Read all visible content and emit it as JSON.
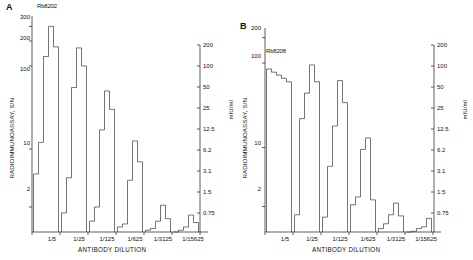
{
  "figure": {
    "panels": [
      {
        "letter": "A",
        "series_label": "Rb8202",
        "ylabel": "RADIOIMMUNOASSAY, S/N",
        "y2label": "mIU/ml",
        "xlabel": "ANTIBODY DILUTION",
        "yticks": [
          "300",
          "200",
          "100",
          "10",
          "2"
        ],
        "y2ticks": [
          "200",
          "100",
          "50",
          "25",
          "12.5",
          "6.2",
          "3.1",
          "1.5",
          "0.75"
        ],
        "xticks": [
          "1/5",
          "1/25",
          "1/125",
          "1/625",
          "1/3125",
          "1/15625"
        ]
      },
      {
        "letter": "B",
        "series_label": "Rb8208",
        "ylabel": "RADIOIMMUNOASSAY, S/N",
        "y2label": "mIU/ml",
        "xlabel": "ANTIBODY DILUTION",
        "yticks": [
          "200",
          "100",
          "10",
          "2"
        ],
        "y2ticks": [
          "200",
          "100",
          "50",
          "25",
          "12.5",
          "6.2",
          "3.1",
          "1.5",
          "0.75"
        ],
        "xticks": [
          "1/5",
          "1/25",
          "1/125",
          "1/625",
          "1/3125",
          "1/15625"
        ]
      }
    ]
  },
  "chart_data": [
    {
      "type": "bar",
      "title": "Rb8202",
      "panel": "A",
      "xlabel": "ANTIBODY DILUTION",
      "ylabel": "RADIOIMMUNOASSAY, S/N",
      "y2label": "mIU/ml",
      "yscale": "log",
      "ylim": [
        1,
        400
      ],
      "y_tick_values": [
        300,
        200,
        100,
        10,
        2
      ],
      "y2_tick_values": [
        200,
        100,
        50,
        25,
        12.5,
        6.2,
        3.1,
        1.5,
        0.75
      ],
      "categories": [
        "1/5",
        "1/25",
        "1/125",
        "1/625",
        "1/3125",
        "1/15625"
      ],
      "groups": [
        {
          "dilution": "1/5",
          "steps": [
            5.0,
            12.0,
            130.0,
            300.0,
            170.0
          ]
        },
        {
          "dilution": "1/25",
          "steps": [
            1.7,
            4.5,
            55.0,
            165.0,
            100.0
          ]
        },
        {
          "dilution": "1/125",
          "steps": [
            1.35,
            2.0,
            17.0,
            50.0,
            30.0
          ]
        },
        {
          "dilution": "1/625",
          "steps": [
            1.15,
            1.25,
            4.2,
            12.5,
            7.0
          ]
        },
        {
          "dilution": "1/3125",
          "steps": [
            1.05,
            1.1,
            1.35,
            2.1,
            1.45
          ]
        },
        {
          "dilution": "1/15625",
          "steps": [
            1.0,
            1.05,
            1.15,
            1.6,
            1.3
          ]
        }
      ]
    },
    {
      "type": "bar",
      "title": "Rb8208",
      "panel": "B",
      "xlabel": "ANTIBODY DILUTION",
      "ylabel": "RADIOIMMUNOASSAY, S/N",
      "y2label": "mIU/ml",
      "yscale": "log",
      "ylim": [
        1,
        260
      ],
      "y_tick_values": [
        200,
        100,
        10,
        2
      ],
      "y2_tick_values": [
        200,
        100,
        50,
        25,
        12.5,
        6.2,
        3.1,
        1.5,
        0.75
      ],
      "categories": [
        "1/5",
        "1/25",
        "1/125",
        "1/625",
        "1/3125",
        "1/15625"
      ],
      "groups": [
        {
          "dilution": "1/5",
          "steps": [
            85.0,
            78.0,
            72.0,
            66.0,
            60.0
          ]
        },
        {
          "dilution": "1/25",
          "steps": [
            1.6,
            22.0,
            44.0,
            95.0,
            60.0
          ]
        },
        {
          "dilution": "1/125",
          "steps": [
            1.5,
            6.0,
            18.0,
            62.0,
            34.0
          ]
        },
        {
          "dilution": "1/625",
          "steps": [
            2.1,
            2.6,
            9.5,
            13.0,
            2.4
          ]
        },
        {
          "dilution": "1/3125",
          "steps": [
            1.1,
            1.25,
            1.6,
            2.2,
            1.55
          ]
        },
        {
          "dilution": "1/15625",
          "steps": [
            1.0,
            1.02,
            1.1,
            1.15,
            1.45
          ]
        }
      ]
    }
  ]
}
